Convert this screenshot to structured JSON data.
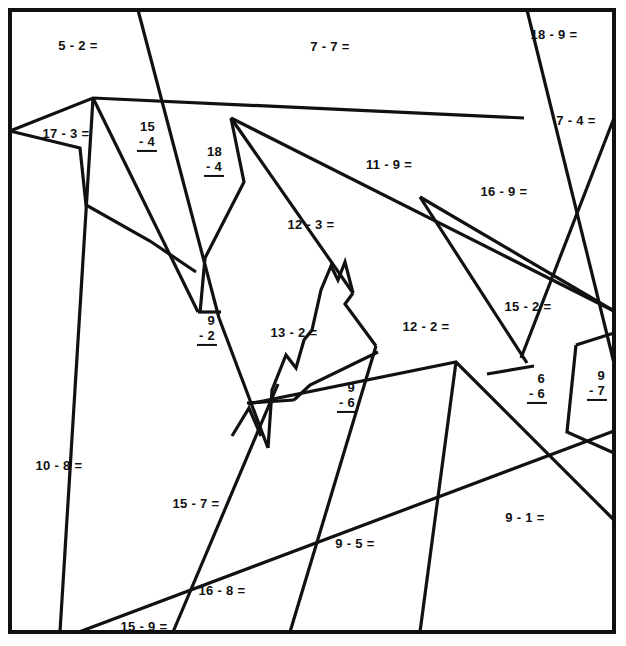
{
  "page": {
    "kind": "math-coloring-worksheet",
    "width": 626,
    "height": 646,
    "background_color": "#ffffff",
    "ink_color": "#111111",
    "border": {
      "x": 8,
      "y": 8,
      "width": 608,
      "height": 626,
      "stroke_width": 4
    }
  },
  "problems": [
    {
      "id": "p01",
      "text": "5 - 2 =",
      "format": "inline",
      "x": 78,
      "y": 46
    },
    {
      "id": "p02",
      "text": "7 - 7 =",
      "format": "inline",
      "x": 330,
      "y": 47
    },
    {
      "id": "p03",
      "text": "18 - 9 =",
      "format": "inline",
      "x": 554,
      "y": 35
    },
    {
      "id": "p04",
      "text": "17 - 3 =",
      "format": "inline",
      "x": 66,
      "y": 134
    },
    {
      "id": "p05",
      "minuend": "15",
      "subtrahend": "- 4",
      "format": "stacked",
      "x": 147,
      "y": 136
    },
    {
      "id": "p06",
      "minuend": "18",
      "subtrahend": "- 4",
      "format": "stacked",
      "x": 214,
      "y": 161
    },
    {
      "id": "p07",
      "text": "7 - 4 =",
      "format": "inline",
      "x": 576,
      "y": 121
    },
    {
      "id": "p08",
      "text": "11 - 9 =",
      "format": "inline",
      "x": 389,
      "y": 165
    },
    {
      "id": "p09",
      "text": "16 - 9 =",
      "format": "inline",
      "x": 504,
      "y": 192
    },
    {
      "id": "p10",
      "text": "12 - 3 =",
      "format": "inline",
      "x": 311,
      "y": 225
    },
    {
      "id": "p11",
      "text": "15 - 2 =",
      "format": "inline",
      "x": 528,
      "y": 307
    },
    {
      "id": "p12",
      "minuend": "9",
      "subtrahend": "- 2",
      "format": "stacked",
      "x": 207,
      "y": 330
    },
    {
      "id": "p13",
      "text": "13 - 2 =",
      "format": "inline",
      "x": 294,
      "y": 333
    },
    {
      "id": "p14",
      "text": "12 - 2 =",
      "format": "inline",
      "x": 426,
      "y": 327
    },
    {
      "id": "p15",
      "minuend": "6",
      "subtrahend": "- 6",
      "format": "stacked",
      "x": 537,
      "y": 388
    },
    {
      "id": "p16",
      "minuend": "9",
      "subtrahend": "- 7",
      "format": "stacked",
      "x": 597,
      "y": 385
    },
    {
      "id": "p17",
      "minuend": "9",
      "subtrahend": "- 6",
      "format": "stacked",
      "x": 347,
      "y": 397
    },
    {
      "id": "p18",
      "text": "10 - 8 =",
      "format": "inline",
      "x": 59,
      "y": 466
    },
    {
      "id": "p19",
      "text": "15 - 7 =",
      "format": "inline",
      "x": 196,
      "y": 504
    },
    {
      "id": "p20",
      "text": "9 - 1 =",
      "format": "inline",
      "x": 525,
      "y": 518
    },
    {
      "id": "p21",
      "text": "9 - 5 =",
      "format": "inline",
      "x": 355,
      "y": 544
    },
    {
      "id": "p22",
      "text": "16 - 8 =",
      "format": "inline",
      "x": 222,
      "y": 591
    },
    {
      "id": "p23",
      "text": "15 - 9 =",
      "format": "inline",
      "x": 144,
      "y": 627
    }
  ],
  "paths": {
    "frame": "M 10 10 L 614 10 L 614 632 L 10 632 Z",
    "lines": [
      "M 138 10 L 214 313",
      "M 10 131 L 93 98 L 524 118",
      "M 10 131 L 93 98",
      "M 93 98 L 60 632",
      "M 93 98 L 200 313",
      "M 10 131 L 80 148 L 86 205 L 148 240 L 195 270",
      "M 86 205 L 148 240",
      "M 231 118 L 614 310",
      "M 231 118 L 352 292",
      "M 231 118 L 214 313",
      "M 200 313 L 231 118",
      "M 231 118 L 205 256 L 200 313",
      "M 200 313 L 214 313",
      "M 214 313 L 265 447 L 246 410 L 232 436",
      "M 265 447 L 290 358 L 303 372 L 312 330 L 322 290 L 330 268 L 337 278 L 345 261 L 352 292",
      "M 352 292 L 347 300 L 372 340",
      "M 372 340 L 378 352 L 456 362",
      "M 456 362 L 614 520",
      "M 527 10 L 614 360",
      "M 614 118 L 526 355",
      "M 420 197 L 614 310",
      "M 420 197 L 523 363",
      "M 79 632 L 614 431",
      "M 173 632 L 300 339",
      "M 290 632 L 372 340",
      "M 456 362 L 420 632",
      "M 487 373 L 535 366 L 520 378",
      "M 575 348 L 614 332",
      "M 575 348 L 568 432 L 614 452",
      "M 614 332 L 575 348"
    ]
  }
}
